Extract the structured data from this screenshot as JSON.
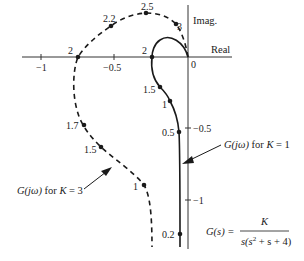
{
  "diagram": {
    "type": "nyquist-plot",
    "axes": {
      "real_label": "Real",
      "imag_label": "Imag.",
      "origin_label": "0",
      "real_ticks": [
        {
          "value": -1,
          "label": "−1"
        },
        {
          "value": -0.5,
          "label": "−0.5"
        }
      ],
      "imag_ticks": [
        {
          "value": -0.5,
          "label": "−0.5"
        },
        {
          "value": -1,
          "label": "−1"
        }
      ]
    },
    "curves": [
      {
        "name": "K=1",
        "style": "solid",
        "annotation": {
          "prefix": "G(jω)",
          "middle": " for ",
          "var": "K",
          "suffix": " = 1"
        },
        "points": [
          {
            "omega": "2",
            "label": "2"
          },
          {
            "omega": "1.5",
            "label": "1.5"
          },
          {
            "omega": "1",
            "label": "1"
          },
          {
            "omega": "0.5",
            "label": "0.5"
          },
          {
            "omega": "0.2",
            "label": "0.2"
          }
        ]
      },
      {
        "name": "K=3",
        "style": "dashed",
        "annotation": {
          "prefix": "G(jω)",
          "middle": " for ",
          "var": "K",
          "suffix": " = 3"
        },
        "points": [
          {
            "omega": "3",
            "label": "3"
          },
          {
            "omega": "2.5",
            "label": "2.5"
          },
          {
            "omega": "2.2",
            "label": "2.2"
          },
          {
            "omega": "2",
            "label": "2"
          },
          {
            "omega": "1.7",
            "label": "1.7"
          },
          {
            "omega": "1.5",
            "label": "1.5"
          },
          {
            "omega": "1",
            "label": "1"
          }
        ]
      }
    ],
    "transfer_function": {
      "lhs": "G(s) =",
      "numerator": "K",
      "denominator_a": "s(s",
      "denominator_exp": "2",
      "denominator_b": " + s + 4)"
    },
    "colors": {
      "line": "#1a1a1a",
      "background": "#ffffff"
    }
  }
}
